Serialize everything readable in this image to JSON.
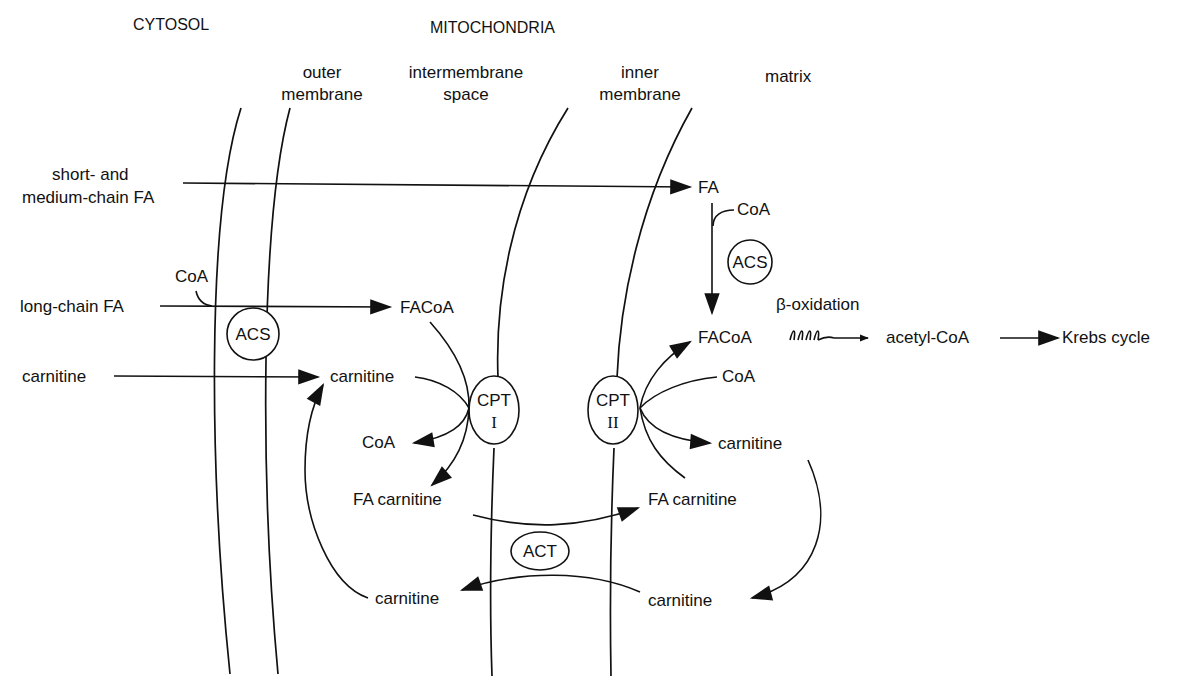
{
  "headers": {
    "cytosol": "CYTOSOL",
    "mitochondria": "MITOCHONDRIA"
  },
  "regions": {
    "outer_membrane": [
      "outer",
      "membrane"
    ],
    "intermembrane_space": [
      "intermembrane",
      "space"
    ],
    "inner_membrane": [
      "inner",
      "membrane"
    ],
    "matrix": "matrix"
  },
  "metabolites": {
    "short_medium_fa": [
      "short- and",
      "medium-chain FA"
    ],
    "long_chain_fa": "long-chain FA",
    "coa_cytosol": "CoA",
    "carnitine_cytosol": "carnitine",
    "facoa_ims": "FACoA",
    "carnitine_ims": "carnitine",
    "coa_ims": "CoA",
    "fa_carnitine_ims": "FA carnitine",
    "carnitine_ims_return": "carnitine",
    "fa_matrix": "FA",
    "coa_matrix_top": "CoA",
    "facoa_matrix": "FACoA",
    "coa_matrix": "CoA",
    "carnitine_matrix": "carnitine",
    "fa_carnitine_matrix": "FA carnitine",
    "carnitine_matrix_return": "carnitine",
    "beta_oxidation": "β-oxidation",
    "acetyl_coa": "acetyl-CoA",
    "krebs_cycle": "Krebs cycle"
  },
  "enzymes": {
    "acs_outer": "ACS",
    "acs_matrix": "ACS",
    "cpt1": [
      "CPT",
      "I"
    ],
    "cpt2": [
      "CPT",
      "II"
    ],
    "act": "ACT"
  },
  "colors": {
    "ink": "#111111",
    "background": "#ffffff"
  }
}
